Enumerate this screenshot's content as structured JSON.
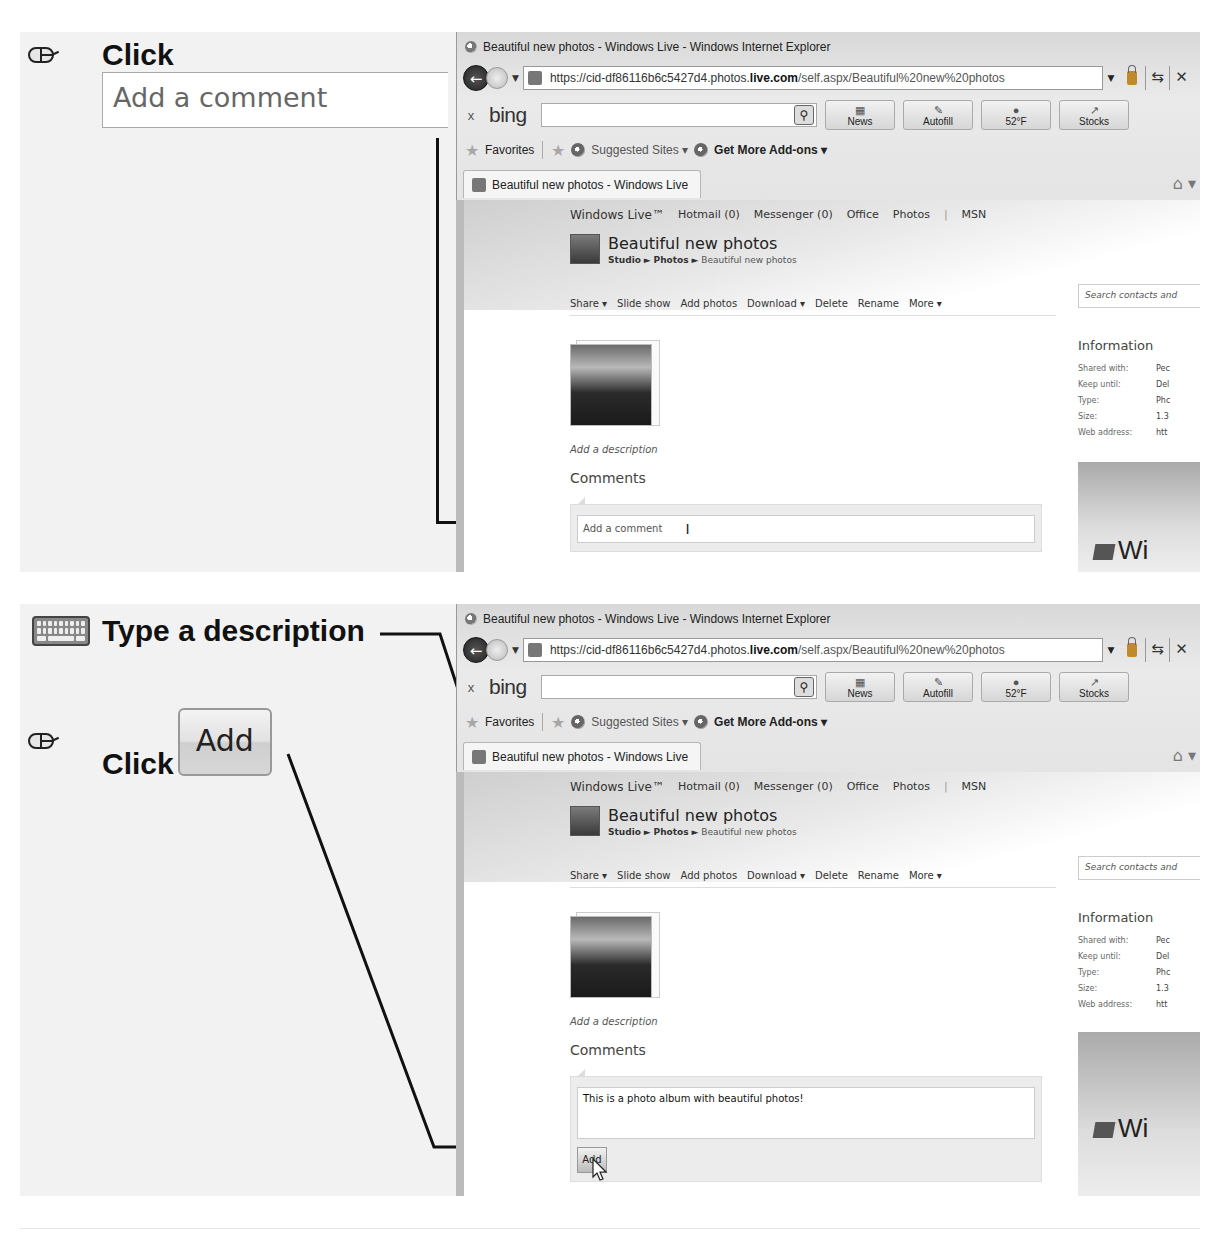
{
  "steps": [
    {
      "instructions": [
        {
          "icon": "mouse-icon",
          "action": "Click",
          "callout_text": "Add a comment"
        }
      ],
      "browser": {
        "window_title": "Beautiful new photos - Windows Live - Windows Internet Explorer",
        "address": {
          "prefix": "https://cid-df86116b6c5427d4.photos.",
          "domain": "live.com",
          "path": "/self.aspx/Beautiful%20new%20photos"
        },
        "bing": {
          "close": "x",
          "logo": "bing",
          "buttons": [
            "News",
            "Autofill",
            "52°F",
            "Stocks"
          ]
        },
        "favorites": {
          "favorites": "Favorites",
          "suggested": "Suggested Sites ▾",
          "addons": "Get More Add-ons ▾"
        },
        "tab_title": "Beautiful new photos - Windows Live",
        "page": {
          "nav": {
            "brand": "Windows Live™",
            "items": [
              "Hotmail (0)",
              "Messenger (0)",
              "Office",
              "Photos",
              "|",
              "MSN"
            ]
          },
          "album_title": "Beautiful new photos",
          "breadcrumb": {
            "studio": "Studio",
            "sep": "►",
            "photos": "Photos",
            "current": "Beautiful new photos"
          },
          "actions": [
            "Share ▾",
            "Slide show",
            "Add photos",
            "Download ▾",
            "Delete",
            "Rename",
            "More ▾"
          ],
          "add_description": "Add a description",
          "comments_heading": "Comments",
          "comment_placeholder": "Add a comment",
          "search_placeholder": "Search contacts and",
          "info_heading": "Information",
          "info": [
            {
              "k": "Shared with:",
              "v": "Pec"
            },
            {
              "k": "Keep until:",
              "v": "Del"
            },
            {
              "k": "Type:",
              "v": "Phc"
            },
            {
              "k": "Size:",
              "v": "1.3"
            },
            {
              "k": "Web address:",
              "v": "htt"
            }
          ],
          "ad_text": "Wi"
        }
      }
    },
    {
      "instructions": [
        {
          "icon": "keyboard-icon",
          "action": "Type a description"
        },
        {
          "icon": "mouse-icon",
          "action": "Click",
          "button_label": "Add"
        }
      ],
      "browser": {
        "comment_value": "This is a photo album with beautiful photos!",
        "add_button": "Add"
      }
    }
  ]
}
